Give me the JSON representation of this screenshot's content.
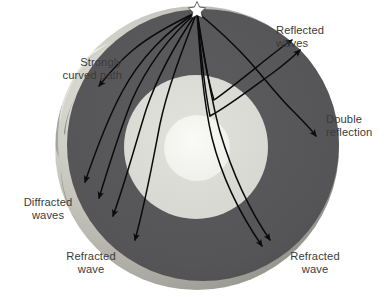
{
  "figure": {
    "background_color": "#FFFFFF"
  },
  "earth": {
    "center_x": 197,
    "center_y": 148,
    "layers": [
      {
        "name": "mantle",
        "label": "Mantle",
        "radius": 142,
        "color": "#555557"
      },
      {
        "name": "outer-core",
        "label": "Outer core",
        "radius": 72,
        "color": "#DCDCD6"
      },
      {
        "name": "inner-core",
        "label": "Inner core",
        "radius": 33,
        "color": "#F3F3F0"
      }
    ],
    "surface_crescent_color": "#C9C9C2",
    "epicenter": {
      "name": "earthquake-focus-star",
      "symbol": "star",
      "x": 197,
      "y": 8,
      "color": "#FFFFFF"
    }
  },
  "rays": {
    "stroke_color": "#0A0A0A",
    "stroke_width": 1.5,
    "paths": [
      {
        "id": "strongly-curved-path",
        "type": "curved",
        "group": "strongly-curved"
      },
      {
        "id": "reflected-1",
        "type": "reflected",
        "group": "reflected"
      },
      {
        "id": "reflected-2",
        "type": "reflected",
        "group": "reflected"
      },
      {
        "id": "double-reflection",
        "type": "double-reflected",
        "group": "double-reflection"
      },
      {
        "id": "diffracted-1",
        "type": "diffracted",
        "group": "diffracted"
      },
      {
        "id": "diffracted-2",
        "type": "diffracted",
        "group": "diffracted"
      },
      {
        "id": "diffracted-3",
        "type": "diffracted",
        "group": "diffracted"
      },
      {
        "id": "refracted-left",
        "type": "refracted",
        "group": "refracted-left"
      },
      {
        "id": "refracted-right-1",
        "type": "refracted",
        "group": "refracted-right"
      },
      {
        "id": "refracted-right-2",
        "type": "refracted",
        "group": "refracted-right"
      }
    ]
  },
  "labels": {
    "strongly_curved_path": "Strongly\ncurved path",
    "reflected_waves": "Reflected\nwaves",
    "double_reflection": "Double\nreflection",
    "diffracted_waves": "Diffracted\nwaves",
    "refracted_wave_left": "Refracted\nwave",
    "refracted_wave_right": "Refracted\nwave"
  }
}
